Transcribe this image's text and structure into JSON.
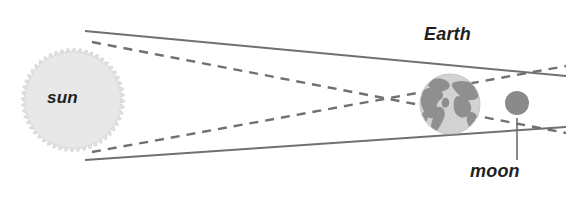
{
  "diagram": {
    "title_labels": {
      "sun": "sun",
      "earth": "Earth",
      "moon": "moon"
    },
    "colors": {
      "background": "#ffffff",
      "sun_fill": "#e8e8e8",
      "sun_corona": "#e0e0e0",
      "earth_ocean": "#d2d2d2",
      "earth_land": "#8f8f8f",
      "moon_fill": "#8a8a8a",
      "line_stroke": "#6f7073",
      "dashed_stroke": "#6f7073",
      "leader_stroke": "#6f7073",
      "text": "#231f20"
    },
    "bodies": [
      {
        "name": "sun",
        "cx": 73,
        "cy": 100,
        "r": 48,
        "corona_r": 57,
        "spikes": 52
      },
      {
        "name": "earth",
        "cx": 450,
        "cy": 104,
        "r": 30
      },
      {
        "name": "moon",
        "cx": 517,
        "cy": 103,
        "r": 12
      }
    ],
    "rays": {
      "solid_upper": {
        "x1": 85,
        "y1": 31,
        "x2": 566,
        "y2": 76
      },
      "solid_lower": {
        "x1": 85,
        "y1": 160,
        "x2": 566,
        "y2": 127
      },
      "dashed_upper": {
        "x1": 92,
        "y1": 42,
        "x2": 566,
        "y2": 133
      },
      "dashed_lower": {
        "x1": 92,
        "y1": 152,
        "x2": 566,
        "y2": 66
      },
      "crossing_point": {
        "x": 330,
        "y": 100
      }
    },
    "leader_line": {
      "x1": 517,
      "y1": 118,
      "x2": 517,
      "y2": 160
    }
  }
}
